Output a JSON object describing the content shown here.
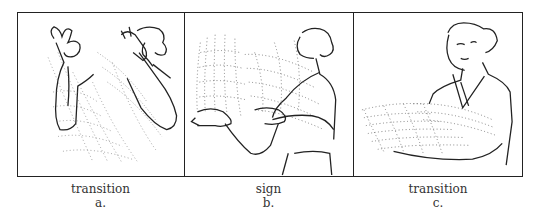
{
  "figure": {
    "panels": [
      {
        "id": "a",
        "caption": "transition",
        "letter": "a.",
        "illustration": "woman-transition-hands-raised-motion-trail"
      },
      {
        "id": "b",
        "caption": "sign",
        "letter": "b.",
        "illustration": "woman-signing-hands-forward-motion-trail"
      },
      {
        "id": "c",
        "caption": "transition",
        "letter": "c.",
        "illustration": "woman-transition-arm-lowered-motion-trail"
      }
    ]
  }
}
